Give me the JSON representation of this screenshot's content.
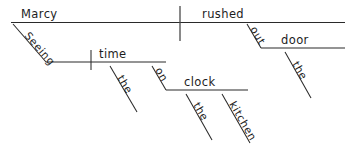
{
  "diagram": {
    "type": "reed-kellogg-sentence-diagram",
    "sentence": "Marcy rushed out the door seeing the time on the kitchen clock",
    "ink_color": "#2a2a2a",
    "background_color": "#ffffff",
    "words": {
      "subject": "Marcy",
      "verb": "rushed",
      "participle": "Seeing",
      "participle_object": "time",
      "participle_object_article": "the",
      "prep_on": "on",
      "prep_on_object": "clock",
      "clock_article": "the",
      "clock_modifier": "kitchen",
      "prep_out": "out",
      "prep_out_object": "door",
      "door_article": "the"
    }
  }
}
